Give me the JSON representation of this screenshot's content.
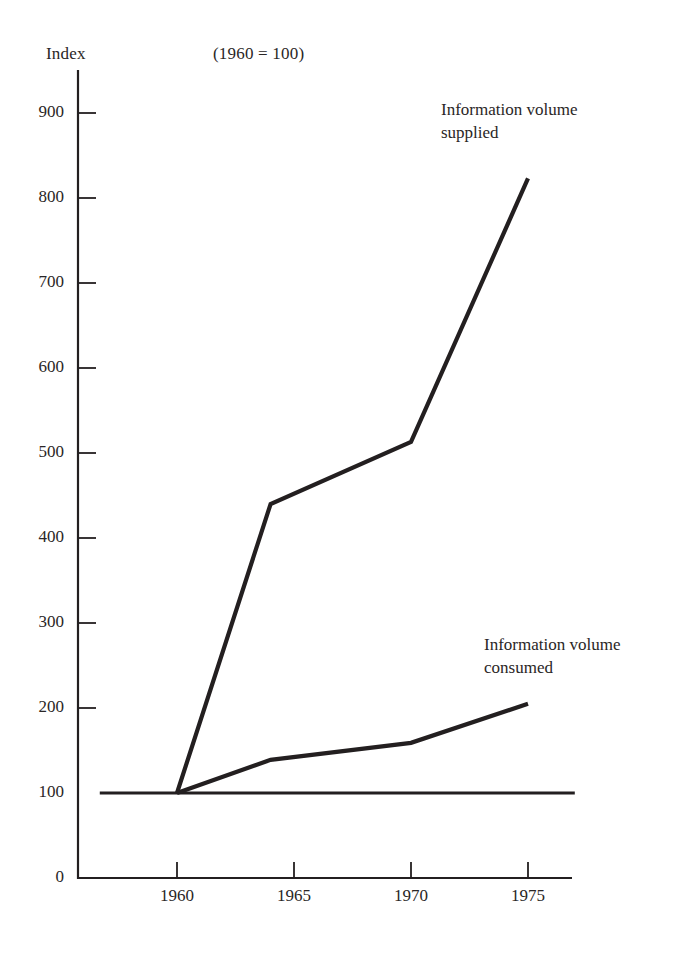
{
  "chart_data": {
    "type": "line",
    "title": "",
    "subtitle": "(1960 = 100)",
    "ylabel": "Index",
    "xlabel": "",
    "xlim": [
      1956.5,
      1977
    ],
    "ylim": [
      0,
      950
    ],
    "grid": false,
    "legend_position": "inline-annotations",
    "yticks": [
      0,
      100,
      200,
      300,
      400,
      500,
      600,
      700,
      800,
      900
    ],
    "ytick_labels": [
      "0",
      "100",
      "200",
      "300",
      "400",
      "500",
      "600",
      "700",
      "800",
      "900"
    ],
    "xticks": [
      1960,
      1965,
      1970,
      1975
    ],
    "xtick_labels": [
      "1960",
      "1965",
      "1970",
      "1975"
    ],
    "reference_line": {
      "name": "baseline-100",
      "value": 100,
      "x_from": 1956.7,
      "x_to": 1977.0
    },
    "series": [
      {
        "name": "Information volume supplied",
        "label_line1": "Information volume",
        "label_line2": "supplied",
        "color": "#231f20",
        "x": [
          1960,
          1964,
          1970,
          1975
        ],
        "values": [
          100,
          440,
          513,
          823
        ]
      },
      {
        "name": "Information volume consumed",
        "label_line1": "Information volume",
        "label_line2": "consumed",
        "color": "#231f20",
        "x": [
          1960,
          1964,
          1970,
          1975
        ],
        "values": [
          100,
          139,
          159,
          205
        ]
      }
    ]
  },
  "labels": {
    "index": "Index",
    "base_note": "(1960 = 100)",
    "supplied_line1": "Information volume",
    "supplied_line2": "supplied",
    "consumed_line1": "Information volume",
    "consumed_line2": "consumed"
  },
  "yticks": [
    {
      "label": "900"
    },
    {
      "label": "800"
    },
    {
      "label": "700"
    },
    {
      "label": "600"
    },
    {
      "label": "500"
    },
    {
      "label": "400"
    },
    {
      "label": "300"
    },
    {
      "label": "200"
    },
    {
      "label": "100"
    },
    {
      "label": "0"
    }
  ],
  "xticks": [
    {
      "label": "1960"
    },
    {
      "label": "1965"
    },
    {
      "label": "1970"
    },
    {
      "label": "1975"
    }
  ],
  "colors": {
    "ink": "#231f20",
    "background": "#ffffff"
  }
}
